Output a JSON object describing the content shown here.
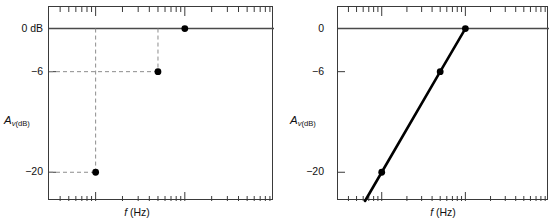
{
  "figure": {
    "panels": [
      {
        "id": "left",
        "name": "discrete-points-plot",
        "x_axis": {
          "label_italic": "f",
          "label_unit": "(Hz)",
          "scale": "log",
          "tick_labels": [
            {
              "value": 10,
              "text": "10"
            },
            {
              "value": 50,
              "text": "50"
            },
            {
              "value": 100,
              "text": "100"
            }
          ],
          "decade_min": 3,
          "decade_max": 1000
        },
        "y_axis": {
          "label_italic": "A",
          "label_sub_italic": "v",
          "label_sub_unit": "(dB)",
          "tick_labels": [
            {
              "value": 0,
              "text": "0 dB"
            },
            {
              "value": -6,
              "text": "−6"
            },
            {
              "value": -20,
              "text": "−20"
            }
          ],
          "min": -24,
          "max": 3
        },
        "points": [
          {
            "x": 10,
            "y": -20
          },
          {
            "x": 50,
            "y": -6
          },
          {
            "x": 100,
            "y": 0
          }
        ],
        "guides": "dashed",
        "connected": false
      },
      {
        "id": "right",
        "name": "line-plot",
        "x_axis": {
          "label_italic": "f",
          "label_unit": "(Hz)",
          "scale": "log",
          "tick_labels": [
            {
              "value": 100,
              "text": "100"
            }
          ],
          "decade_min": 3,
          "decade_max": 1000
        },
        "y_axis": {
          "label_italic": "A",
          "label_sub_italic": "v",
          "label_sub_unit": "(dB)",
          "tick_labels": [
            {
              "value": 0,
              "text": "0"
            },
            {
              "value": -6,
              "text": "−6"
            },
            {
              "value": -20,
              "text": "−20"
            }
          ],
          "min": -24,
          "max": 3
        },
        "points": [
          {
            "x": 10,
            "y": -20
          },
          {
            "x": 50,
            "y": -6
          },
          {
            "x": 100,
            "y": 0
          }
        ],
        "guides": "none",
        "connected": true
      }
    ]
  },
  "chart_data": [
    {
      "type": "scatter",
      "title": "",
      "xlabel": "f (Hz)",
      "ylabel": "Av(dB)",
      "xscale": "log",
      "x": [
        10,
        50,
        100
      ],
      "values": [
        -20,
        -6,
        0
      ],
      "xtick_labels": [
        "10",
        "50",
        "100"
      ],
      "ytick_labels": [
        "0 dB",
        "-6",
        "-20"
      ],
      "xlim": [
        3,
        1000
      ],
      "ylim": [
        -24,
        3
      ],
      "grid": false,
      "legend": "none",
      "annotations": [
        "dashed guide line from x=10 down to point (10,-20)",
        "dashed guide line from x=50 down to point (50,-6)",
        "dashed guide line from y=-6 across to point (50,-6)",
        "dashed guide line from y=-20 across to point (10,-20)"
      ]
    },
    {
      "type": "line",
      "title": "",
      "xlabel": "f (Hz)",
      "ylabel": "Av(dB)",
      "xscale": "log",
      "x": [
        10,
        50,
        100
      ],
      "values": [
        -20,
        -6,
        0
      ],
      "xtick_labels": [
        "100"
      ],
      "ytick_labels": [
        "0",
        "-6",
        "-20"
      ],
      "xlim": [
        3,
        1000
      ],
      "ylim": [
        -24,
        3
      ],
      "grid": false,
      "legend": "none",
      "annotations": [
        "straight line of constant slope (20 dB/decade) through all three points, extended below -20 dB to the bottom axis"
      ]
    }
  ],
  "colors": {
    "frame": "#3a3a3a",
    "axis_zero_line": "#4a4a4a",
    "data": "#000000",
    "guide": "#8d8d8d",
    "text": "#111111",
    "background": "#ffffff"
  }
}
